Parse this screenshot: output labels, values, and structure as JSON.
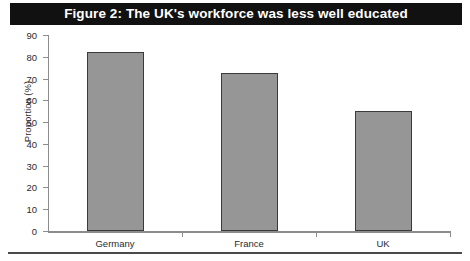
{
  "figure": {
    "title": "Figure 2: The UK's workforce was less well educated",
    "banner_color": "#111111",
    "banner_text_color": "#ffffff"
  },
  "chart_data": {
    "type": "bar",
    "title": "Figure 2: The UK's workforce was less well educated",
    "categories": [
      "Germany",
      "France",
      "UK"
    ],
    "values": [
      82,
      72.5,
      55
    ],
    "xlabel": "",
    "ylabel": "Proportion (%)",
    "ylim": [
      0,
      90
    ],
    "ytick_step": 10,
    "yticks": [
      0,
      10,
      20,
      30,
      40,
      50,
      60,
      70,
      80,
      90
    ],
    "ytick_labels": [
      "0",
      "10",
      "20",
      "30",
      "40",
      "50",
      "60",
      "70",
      "80",
      "90"
    ],
    "grid": false,
    "legend": false,
    "bar_fill_color": "#969696",
    "bar_border_color": "#3a3a3a",
    "axis_color": "#8c8c8c"
  }
}
